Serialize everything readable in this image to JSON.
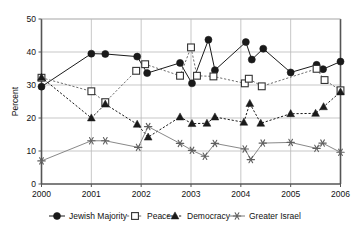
{
  "chart_data": {
    "type": "line",
    "title": "",
    "xlabel": "",
    "ylabel": "Percent",
    "xlim": [
      2000,
      2006
    ],
    "ylim": [
      0,
      50
    ],
    "ytick_labels": [
      "0",
      "10",
      "20",
      "30",
      "40",
      "50"
    ],
    "yticks": [
      0,
      10,
      20,
      30,
      40,
      50
    ],
    "xtick_labels": [
      "2000",
      "2001",
      "2002",
      "2003",
      "2004",
      "2005",
      "2006"
    ],
    "xticks": [
      2000,
      2001,
      2002,
      2003,
      2004,
      2005,
      2006
    ],
    "grid": "horizontal-and-vertical",
    "legend_position": "bottom",
    "series": [
      {
        "name": "Jewish Majority",
        "marker": "filled-circle",
        "line_style": "solid",
        "color": "#1a1a1a",
        "points": [
          {
            "x": 2000.0,
            "y": 29.5
          },
          {
            "x": 2001.0,
            "y": 39.5
          },
          {
            "x": 2001.28,
            "y": 39.4
          },
          {
            "x": 2001.92,
            "y": 38.6
          },
          {
            "x": 2002.12,
            "y": 33.6
          },
          {
            "x": 2002.78,
            "y": 36.7
          },
          {
            "x": 2003.02,
            "y": 30.5
          },
          {
            "x": 2003.35,
            "y": 43.7
          },
          {
            "x": 2003.48,
            "y": 34.5
          },
          {
            "x": 2004.1,
            "y": 43.0
          },
          {
            "x": 2004.22,
            "y": 37.7
          },
          {
            "x": 2004.45,
            "y": 41.0
          },
          {
            "x": 2005.0,
            "y": 33.8
          },
          {
            "x": 2005.52,
            "y": 36.1
          },
          {
            "x": 2005.65,
            "y": 34.8
          },
          {
            "x": 2006.0,
            "y": 37.1
          }
        ]
      },
      {
        "name": "Peace",
        "marker": "open-square",
        "line_style": "dashed",
        "color": "#6e6e6e",
        "points": [
          {
            "x": 2000.0,
            "y": 32.2
          },
          {
            "x": 2001.0,
            "y": 28.1
          },
          {
            "x": 2001.28,
            "y": 24.8
          },
          {
            "x": 2001.9,
            "y": 34.3
          },
          {
            "x": 2002.08,
            "y": 36.3
          },
          {
            "x": 2002.78,
            "y": 32.8
          },
          {
            "x": 2003.0,
            "y": 41.4
          },
          {
            "x": 2003.12,
            "y": 32.8
          },
          {
            "x": 2003.45,
            "y": 32.6
          },
          {
            "x": 2004.08,
            "y": 30.5
          },
          {
            "x": 2004.16,
            "y": 31.9
          },
          {
            "x": 2004.42,
            "y": 29.6
          },
          {
            "x": 2005.52,
            "y": 34.9
          },
          {
            "x": 2005.68,
            "y": 31.5
          },
          {
            "x": 2006.0,
            "y": 28.4
          }
        ]
      },
      {
        "name": "Democracy",
        "marker": "filled-triangle",
        "line_style": "dashed",
        "color": "#1a1a1a",
        "points": [
          {
            "x": 2000.0,
            "y": 32.3
          },
          {
            "x": 2001.0,
            "y": 20.0
          },
          {
            "x": 2001.28,
            "y": 24.2
          },
          {
            "x": 2001.92,
            "y": 18.1
          },
          {
            "x": 2002.14,
            "y": 14.2
          },
          {
            "x": 2002.78,
            "y": 20.3
          },
          {
            "x": 2003.02,
            "y": 18.3
          },
          {
            "x": 2003.32,
            "y": 18.4
          },
          {
            "x": 2003.48,
            "y": 20.3
          },
          {
            "x": 2004.06,
            "y": 18.7
          },
          {
            "x": 2004.18,
            "y": 24.4
          },
          {
            "x": 2004.4,
            "y": 18.4
          },
          {
            "x": 2005.0,
            "y": 21.3
          },
          {
            "x": 2005.5,
            "y": 21.4
          },
          {
            "x": 2005.66,
            "y": 23.4
          },
          {
            "x": 2006.0,
            "y": 27.9
          }
        ]
      },
      {
        "name": "Greater Israel",
        "marker": "asterisk",
        "line_style": "solid",
        "color": "#7a7a7a",
        "points": [
          {
            "x": 2000.0,
            "y": 7.0
          },
          {
            "x": 2001.0,
            "y": 13.1
          },
          {
            "x": 2001.28,
            "y": 13.1
          },
          {
            "x": 2001.94,
            "y": 11.1
          },
          {
            "x": 2002.14,
            "y": 17.4
          },
          {
            "x": 2002.78,
            "y": 12.3
          },
          {
            "x": 2003.02,
            "y": 10.2
          },
          {
            "x": 2003.28,
            "y": 8.4
          },
          {
            "x": 2003.48,
            "y": 12.3
          },
          {
            "x": 2004.08,
            "y": 10.6
          },
          {
            "x": 2004.2,
            "y": 7.4
          },
          {
            "x": 2004.44,
            "y": 12.4
          },
          {
            "x": 2005.0,
            "y": 12.6
          },
          {
            "x": 2005.52,
            "y": 10.8
          },
          {
            "x": 2005.64,
            "y": 12.4
          },
          {
            "x": 2006.0,
            "y": 9.6
          }
        ]
      }
    ]
  },
  "axis": {
    "y_title": "Percent"
  },
  "legend": {
    "items": [
      {
        "label": "Jewish Majority",
        "marker": "filled-circle"
      },
      {
        "label": "Peace",
        "marker": "open-square"
      },
      {
        "label": "Democracy",
        "marker": "filled-triangle"
      },
      {
        "label": "Greater Israel",
        "marker": "asterisk"
      }
    ]
  },
  "colors": {
    "axis": "#555555",
    "grid": "#b9b9b9",
    "jewish_majority": "#1a1a1a",
    "peace": "#6e6e6e",
    "democracy": "#1a1a1a",
    "greater_israel": "#7a7a7a",
    "background": "#ffffff"
  }
}
